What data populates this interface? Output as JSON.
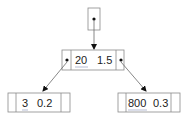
{
  "diagram": {
    "type": "binary-tree",
    "root_pointer": {
      "label": "root"
    },
    "nodes": {
      "root": {
        "key": "20",
        "value": "1.5"
      },
      "left": {
        "key": "3",
        "value": "0.2"
      },
      "right": {
        "key": "800",
        "value": "0.3"
      }
    },
    "edges": [
      {
        "from": "root_pointer",
        "to": "root"
      },
      {
        "from": "root",
        "to": "left",
        "side": "left"
      },
      {
        "from": "root",
        "to": "right",
        "side": "right"
      }
    ]
  },
  "colors": {
    "line": "#8a8a8a",
    "dot": "#111111",
    "text": "#222222"
  }
}
